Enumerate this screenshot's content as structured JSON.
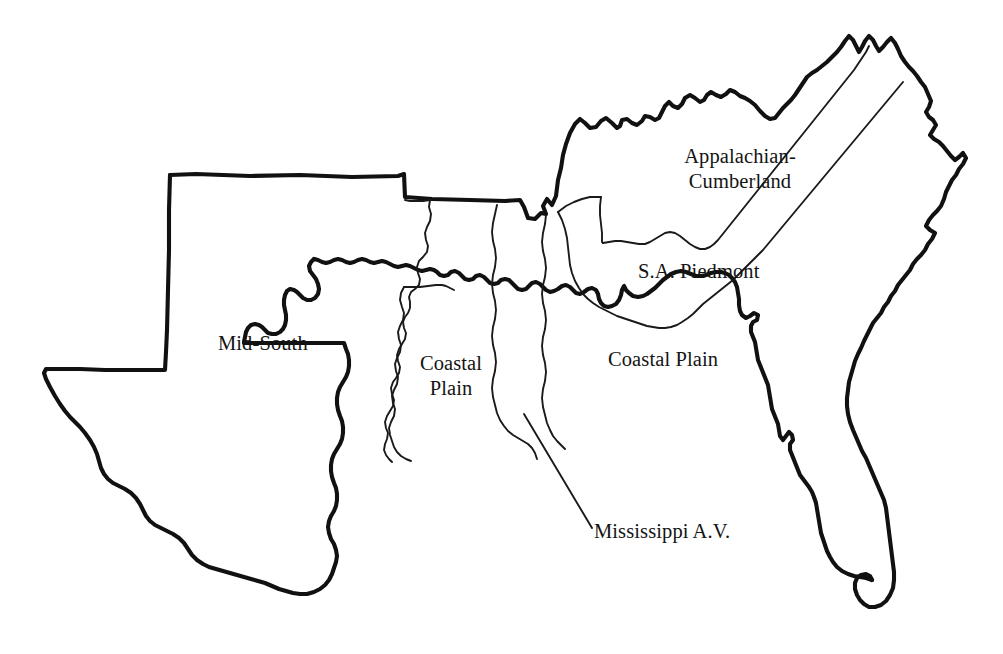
{
  "map": {
    "title": "Southern United States forest resource regions",
    "background_color": "#ffffff",
    "outline_color": "#111111",
    "region_line_color": "#1a1a1a",
    "labels": [
      {
        "id": "mid-south",
        "text": "Mid-South",
        "x": 218,
        "y": 331,
        "width": 200
      },
      {
        "id": "coastal-plain-west",
        "text": "Coastal\nPlain",
        "x": 396,
        "y": 351,
        "width": 110
      },
      {
        "id": "appalachian-cumberland",
        "text": "Appalachian-\nCumberland",
        "x": 640,
        "y": 144,
        "width": 200
      },
      {
        "id": "sa-piedmont",
        "text": "S.A. Piedmont",
        "x": 638,
        "y": 259,
        "width": 180
      },
      {
        "id": "coastal-plain-east",
        "text": "Coastal Plain",
        "x": 608,
        "y": 347,
        "width": 180
      },
      {
        "id": "mississippi-av",
        "text": "Mississippi A.V.",
        "x": 594,
        "y": 519,
        "width": 200
      }
    ],
    "leader_lines": [
      {
        "id": "mississippi-av-leader",
        "x1": 524,
        "y1": 414,
        "x2": 592,
        "y2": 528
      }
    ],
    "regions": [
      "Mid-South",
      "Coastal Plain",
      "Mississippi A.V.",
      "Appalachian-Cumberland",
      "S.A. Piedmont"
    ]
  }
}
